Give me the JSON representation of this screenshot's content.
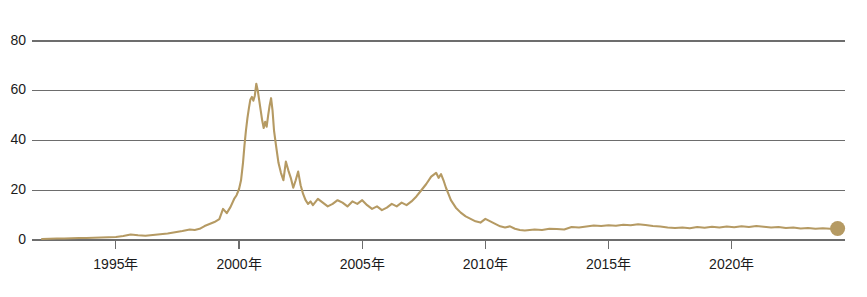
{
  "chart_data": {
    "type": "line",
    "title": "",
    "subtitle": "",
    "xlabel": "",
    "ylabel": "",
    "xlim": [
      1992.0,
      2024.6
    ],
    "ylim": [
      0,
      84
    ],
    "grid": "horizontal",
    "legend": "none",
    "accent_color": "#b59a63",
    "gridline_color": "#6d6d6d",
    "axis_text_color": "#1b1b1b",
    "background_color": "#ffffff",
    "y_ticks": [
      0,
      20,
      40,
      60,
      80
    ],
    "y_tick_labels": [
      "0",
      "20",
      "40",
      "60",
      "80"
    ],
    "x_ticks": [
      1995,
      2000,
      2005,
      2010,
      2015,
      2020
    ],
    "x_tick_labels": [
      "1995年",
      "2000年",
      "2005年",
      "2010年",
      "2015年",
      "2020年"
    ],
    "end_marker": {
      "shape": "circle",
      "x": 2024.3,
      "y": 4.6,
      "color": "#b59a63"
    },
    "series": [
      {
        "name": "series-1",
        "color": "#b59a63",
        "x": [
          1992.0,
          1992.3,
          1992.6,
          1992.9,
          1993.2,
          1993.5,
          1993.8,
          1994.1,
          1994.4,
          1994.7,
          1995.0,
          1995.3,
          1995.6,
          1995.9,
          1996.2,
          1996.5,
          1996.8,
          1997.1,
          1997.4,
          1997.7,
          1998.0,
          1998.2,
          1998.4,
          1998.6,
          1998.8,
          1999.0,
          1999.2,
          1999.35,
          1999.5,
          1999.65,
          1999.8,
          1999.9,
          2000.0,
          2000.08,
          2000.16,
          2000.22,
          2000.28,
          2000.34,
          2000.4,
          2000.46,
          2000.52,
          2000.58,
          2000.64,
          2000.7,
          2000.76,
          2000.82,
          2000.88,
          2000.94,
          2001.0,
          2001.06,
          2001.12,
          2001.18,
          2001.24,
          2001.3,
          2001.36,
          2001.42,
          2001.5,
          2001.6,
          2001.7,
          2001.8,
          2001.9,
          2002.0,
          2002.1,
          2002.2,
          2002.3,
          2002.4,
          2002.5,
          2002.6,
          2002.7,
          2002.8,
          2002.9,
          2003.0,
          2003.2,
          2003.4,
          2003.6,
          2003.8,
          2004.0,
          2004.2,
          2004.4,
          2004.6,
          2004.8,
          2005.0,
          2005.2,
          2005.4,
          2005.6,
          2005.8,
          2006.0,
          2006.2,
          2006.4,
          2006.6,
          2006.8,
          2007.0,
          2007.2,
          2007.4,
          2007.6,
          2007.8,
          2008.0,
          2008.1,
          2008.2,
          2008.3,
          2008.4,
          2008.5,
          2008.6,
          2008.8,
          2009.0,
          2009.2,
          2009.4,
          2009.6,
          2009.8,
          2010.0,
          2010.2,
          2010.4,
          2010.6,
          2010.8,
          2011.0,
          2011.2,
          2011.4,
          2011.6,
          2011.8,
          2012.0,
          2012.3,
          2012.6,
          2012.9,
          2013.2,
          2013.5,
          2013.8,
          2014.1,
          2014.4,
          2014.7,
          2015.0,
          2015.3,
          2015.6,
          2015.9,
          2016.2,
          2016.5,
          2016.8,
          2017.1,
          2017.4,
          2017.7,
          2018.0,
          2018.3,
          2018.6,
          2018.9,
          2019.2,
          2019.5,
          2019.8,
          2020.1,
          2020.4,
          2020.7,
          2021.0,
          2021.3,
          2021.6,
          2021.9,
          2022.2,
          2022.5,
          2022.8,
          2023.1,
          2023.4,
          2023.7,
          2024.0,
          2024.3
        ],
        "y": [
          0.4,
          0.5,
          0.6,
          0.6,
          0.7,
          0.8,
          0.8,
          0.9,
          1.0,
          1.1,
          1.2,
          1.6,
          2.2,
          1.9,
          1.7,
          2.0,
          2.3,
          2.6,
          3.1,
          3.6,
          4.2,
          4.0,
          4.5,
          5.6,
          6.4,
          7.2,
          8.4,
          12.5,
          10.8,
          13.2,
          16.5,
          18.0,
          20.5,
          24.0,
          31.0,
          38.0,
          44.0,
          49.0,
          53.0,
          56.5,
          57.5,
          56.0,
          58.0,
          62.8,
          60.0,
          56.0,
          52.0,
          48.0,
          45.0,
          47.5,
          45.5,
          50.0,
          54.0,
          57.0,
          52.0,
          44.0,
          38.0,
          31.0,
          27.0,
          24.0,
          31.5,
          28.0,
          25.0,
          21.0,
          24.0,
          27.5,
          22.0,
          18.5,
          16.0,
          14.5,
          15.5,
          14.0,
          16.5,
          15.0,
          13.5,
          14.5,
          16.0,
          15.0,
          13.5,
          15.5,
          14.5,
          16.0,
          14.0,
          12.5,
          13.5,
          12.0,
          13.0,
          14.5,
          13.5,
          15.0,
          14.0,
          15.5,
          17.5,
          20.0,
          22.5,
          25.5,
          27.0,
          25.0,
          26.5,
          24.0,
          21.0,
          18.5,
          16.0,
          13.0,
          11.0,
          9.5,
          8.5,
          7.5,
          7.0,
          8.5,
          7.5,
          6.5,
          5.5,
          5.0,
          5.5,
          4.5,
          4.0,
          3.8,
          4.0,
          4.2,
          4.0,
          4.5,
          4.4,
          4.2,
          5.2,
          5.0,
          5.4,
          5.8,
          5.6,
          5.9,
          5.7,
          6.1,
          5.9,
          6.3,
          6.0,
          5.6,
          5.4,
          5.0,
          4.8,
          5.0,
          4.7,
          5.2,
          4.9,
          5.3,
          5.0,
          5.4,
          5.1,
          5.5,
          5.2,
          5.6,
          5.3,
          5.0,
          5.2,
          4.8,
          5.0,
          4.6,
          4.8,
          4.5,
          4.7,
          4.5,
          4.6
        ]
      }
    ]
  },
  "plot_geometry": {
    "left": 42,
    "right": 845,
    "top": 31,
    "bottom": 240
  }
}
